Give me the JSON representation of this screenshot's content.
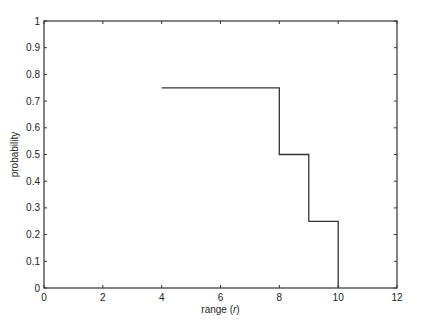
{
  "chart_data": {
    "type": "line",
    "subtype": "step",
    "title": "",
    "xlabel": "range (r)",
    "ylabel": "probability",
    "xlim": [
      0,
      12
    ],
    "ylim": [
      0,
      1
    ],
    "xticks": [
      0,
      2,
      4,
      6,
      8,
      10,
      12
    ],
    "yticks": [
      0,
      0.1,
      0.2,
      0.3,
      0.4,
      0.5,
      0.6,
      0.7,
      0.8,
      0.9,
      1
    ],
    "grid": false,
    "legend": null,
    "series": [
      {
        "name": "probability",
        "color": "#333333",
        "x": [
          4,
          8,
          8,
          9,
          9,
          10,
          10
        ],
        "y": [
          0.75,
          0.75,
          0.5,
          0.5,
          0.25,
          0.25,
          0
        ]
      }
    ]
  },
  "axes": {
    "xlabel_main": "range (",
    "xlabel_var": "r",
    "xlabel_close": ")",
    "ylabel": "probability"
  },
  "colors": {
    "axis": "#333333",
    "line": "#333333",
    "background": "#ffffff"
  }
}
